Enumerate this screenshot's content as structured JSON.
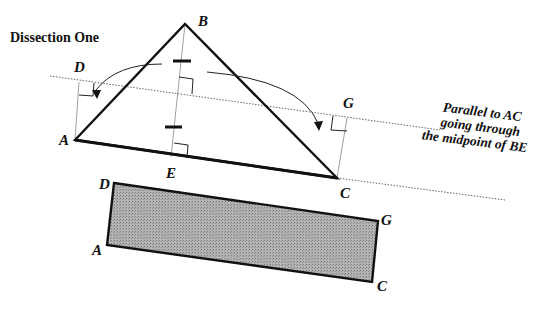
{
  "title": "Dissection One",
  "triangle": {
    "labels": {
      "A": "A",
      "B": "B",
      "C": "C",
      "D": "D",
      "E": "E",
      "G": "G"
    }
  },
  "annotation": {
    "line1": "Parallel to  AC",
    "line2": "going through",
    "line3": "the midpoint of BE"
  },
  "rectangle": {
    "labels": {
      "D": "D",
      "G": "G",
      "A": "A",
      "C": "C"
    },
    "fill": "#a8a8a8"
  },
  "colors": {
    "stroke": "#111111",
    "guide": "#777777"
  }
}
